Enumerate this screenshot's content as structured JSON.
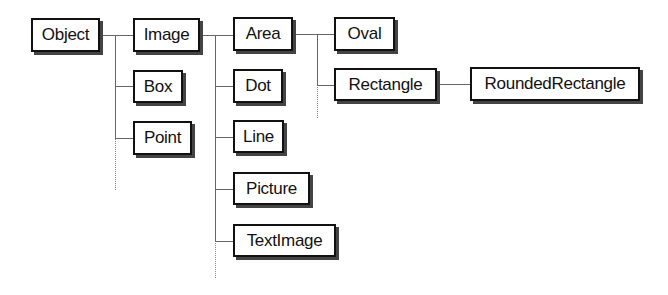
{
  "diagram": {
    "type": "class-hierarchy-tree",
    "nodes": {
      "object": "Object",
      "image": "Image",
      "box": "Box",
      "point": "Point",
      "area": "Area",
      "dot": "Dot",
      "line": "Line",
      "picture": "Picture",
      "textimage": "TextImage",
      "oval": "Oval",
      "rectangle": "Rectangle",
      "roundedrectangle": "RoundedRectangle"
    },
    "edges": [
      [
        "Object",
        "Image"
      ],
      [
        "Object",
        "Box"
      ],
      [
        "Object",
        "Point"
      ],
      [
        "Image",
        "Area"
      ],
      [
        "Image",
        "Dot"
      ],
      [
        "Image",
        "Line"
      ],
      [
        "Image",
        "Picture"
      ],
      [
        "Image",
        "TextImage"
      ],
      [
        "Area",
        "Oval"
      ],
      [
        "Area",
        "Rectangle"
      ],
      [
        "Rectangle",
        "RoundedRectangle"
      ]
    ],
    "open_ended_branches": [
      "Object",
      "Image",
      "Area"
    ]
  }
}
